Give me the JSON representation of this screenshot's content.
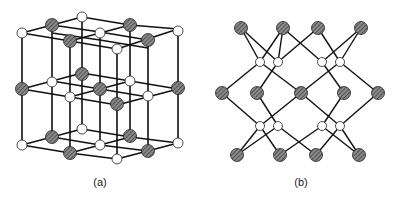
{
  "figure": {
    "panels": [
      {
        "id": "a",
        "label": "(a)",
        "structure": "rock-salt lattice"
      },
      {
        "id": "b",
        "label": "(b)",
        "structure": "tetrahedral network"
      }
    ],
    "colors": {
      "bond": "#111111",
      "atom_light": "#ffffff",
      "atom_dark": "#6e6e6e",
      "atom_outline": "#222222"
    }
  }
}
